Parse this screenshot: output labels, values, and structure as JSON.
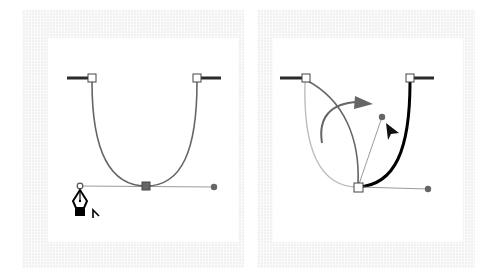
{
  "figure": {
    "panels": [
      {
        "id": "left",
        "label": "Smooth U-shaped curve with pen tool over direction point",
        "anchors": [
          {
            "name": "top-left",
            "x": 92,
            "y": 78,
            "style": "hollow-square"
          },
          {
            "name": "top-right",
            "x": 197,
            "y": 78,
            "style": "hollow-square"
          },
          {
            "name": "bottom",
            "x": 146,
            "y": 186,
            "style": "filled-square"
          }
        ],
        "handles": [
          {
            "from": [
              146,
              186
            ],
            "to": [
              80,
              186
            ],
            "end": "hollow-dot"
          },
          {
            "from": [
              146,
              186
            ],
            "to": [
              214,
              187
            ],
            "end": "filled-dot"
          }
        ],
        "cursor": "pen-convert-icon"
      },
      {
        "id": "right",
        "label": "Direction handle dragged to create a corner point",
        "anchors": [
          {
            "name": "top-left",
            "x": 306,
            "y": 78,
            "style": "hollow-square"
          },
          {
            "name": "top-right",
            "x": 410,
            "y": 78,
            "style": "hollow-square"
          },
          {
            "name": "bottom",
            "x": 358,
            "y": 187,
            "style": "hollow-square"
          }
        ],
        "handles": [
          {
            "from": [
              358,
              187
            ],
            "to": [
              382,
              117
            ],
            "end": "filled-dot"
          },
          {
            "from": [
              358,
              187
            ],
            "to": [
              428,
              189
            ],
            "end": "filled-dot"
          }
        ],
        "cursor": "arrow-cursor-icon",
        "annotation": "curved-arrow-icon"
      }
    ],
    "colors": {
      "path": "#666666",
      "path_original": "#bdbdbd",
      "path_active": "#000000",
      "handle_line": "#9a9a9a",
      "handle_dot": "#666666",
      "stub": "#2a2a2a",
      "arrow": "#666666",
      "frame": "#f1f1f1"
    }
  }
}
